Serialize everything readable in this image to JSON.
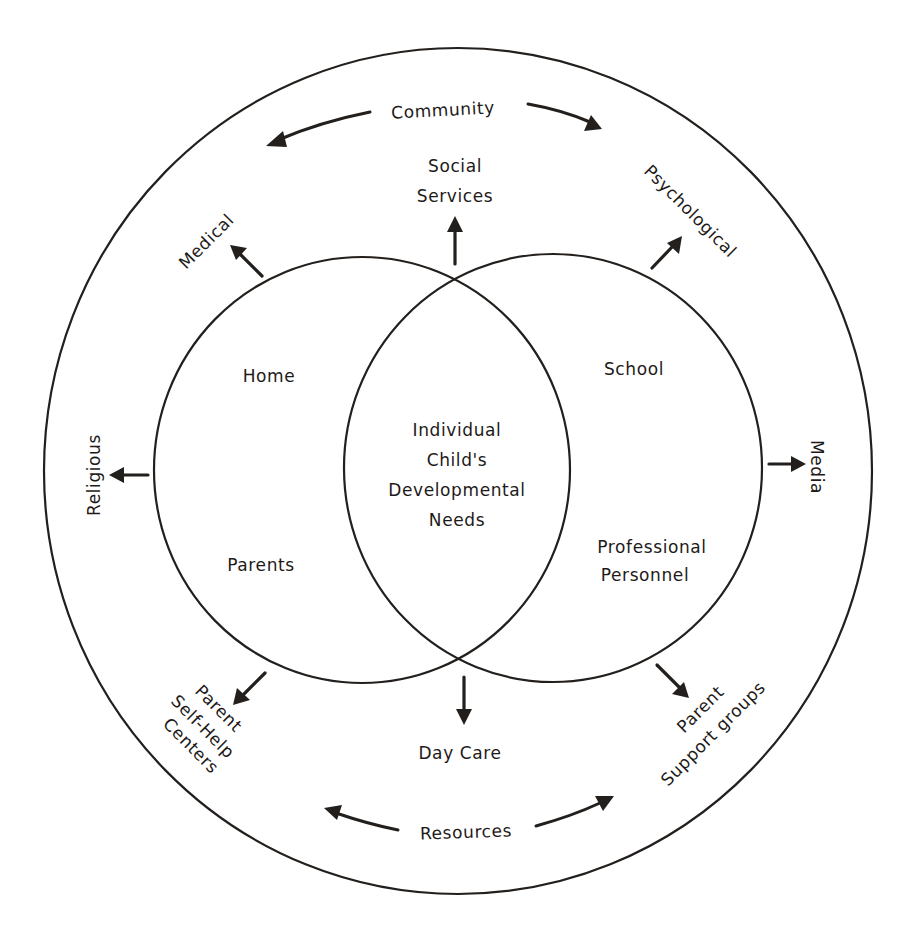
{
  "diagram": {
    "type": "nested-venn-ecological-model",
    "colors": {
      "background": "#ffffff",
      "line": "#231f1c",
      "text": "#1e1a18"
    },
    "outer_circle": {
      "label_top": "Community",
      "label_bottom": "Resources"
    },
    "left_circle": {
      "label_top": "Home",
      "label_bottom": "Parents"
    },
    "right_circle": {
      "label_top": "School",
      "label_bottom_line1": "Professional",
      "label_bottom_line2": "Personnel"
    },
    "center": {
      "line1": "Individual",
      "line2": "Child's",
      "line3": "Developmental",
      "line4": "Needs"
    },
    "resources": {
      "social_services_line1": "Social",
      "social_services_line2": "Services",
      "medical": "Medical",
      "psychological": "Psychological",
      "religious": "Religious",
      "media": "Media",
      "day_care": "Day Care",
      "parent_self_help_line1": "Parent",
      "parent_self_help_line2": "Self-Help",
      "parent_self_help_line3": "Centers",
      "parent_support_line1": "Parent",
      "parent_support_line2": "Support groups"
    }
  }
}
